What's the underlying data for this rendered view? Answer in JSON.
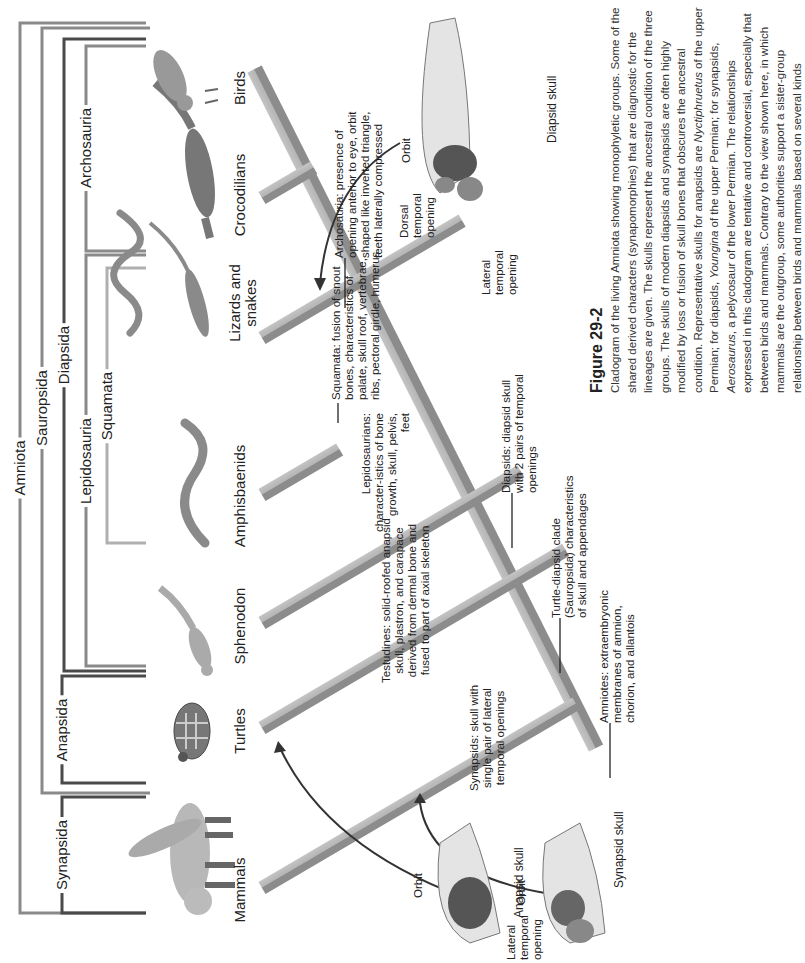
{
  "clades": {
    "amniota": "Amniota",
    "synapsida": "Synapsida",
    "sauropsida": "Sauropsida",
    "anapsida": "Anapsida",
    "diapsida": "Diapsida",
    "lepidosauria": "Lepidosauria",
    "archosauria": "Archosauria",
    "squamata": "Squamata"
  },
  "taxa": [
    {
      "label": "Mammals"
    },
    {
      "label": "Turtles"
    },
    {
      "label": "Sphenodon"
    },
    {
      "label": "Amphisbaenids"
    },
    {
      "label": "Lizards and snakes"
    },
    {
      "label": "Crocodilians"
    },
    {
      "label": "Birds"
    }
  ],
  "annotations": {
    "archosauria": "Archosauria: presence of opening anterior to eye, orbit shaped like inverted triangle, teeth laterally compressed",
    "squamata": "Squamata: fusion of snout bones, characteristics of palate, skull roof, vertebrae, ribs, pectoral girdle, humerus",
    "lepidosaurians": "Lepidosaurians: character-istics of bone growth, skull, pelvis, feet",
    "diapsids": "Diapsids: diapsid skull with 2 pairs of temporal openings",
    "testudines": "Testudines: solid-roofed anapsid skull, plastron, and carapace derived from dermal bone and fused to part of axial skeleton",
    "turtle_diapsid": "Turtle-diapsid clade (Sauropsida) characteristics of skull and appendages",
    "synapsids": "Synapsids: skull with single pair of lateral temporal openings",
    "amniotes": "Amniotes: extraembryonic membranes of amnion, chorion, and allantois"
  },
  "skulls": {
    "diapsid": {
      "caption": "Diapsid skull",
      "orbit": "Orbit",
      "dorsal": "Dorsal temporal opening",
      "lateral": "Lateral temporal opening"
    },
    "anapsid": {
      "caption": "Anapsid skull",
      "orbit": "Orbit"
    },
    "synapsid": {
      "caption": "Synapsid skull",
      "orbit": "Orbit",
      "lateral": "Lateral temporal opening"
    }
  },
  "figure": {
    "title": "Figure 29-2",
    "caption_parts": [
      "Cladogram of the living Amniota showing monophyletic groups. Some of the shared derived characters (synapomorphies) that are diagnostic for the lineages are given. The skulls represent the ancestral condition of the three groups. The skulls of modern diapsids and synapsids are often highly modified by loss or fusion of skull bones that obscures the ancestral condition. Representative skulls for anapsids are ",
      "Nyctiphruetus",
      " of the upper Permian; for diapsids, ",
      "Youngina",
      " of the upper Permian; for synapsids, ",
      "Aerosaurus",
      ", a pelycosaur of the lower Permian. The relationships expressed in this cladogram are tentative and controversial, especially that between birds and mammals. Contrary to the view shown here, in which mammals are the outgroup, some authorities support a sister-group relationship between birds and mammals based on several kinds"
    ]
  },
  "colors": {
    "bracket_dark": "#4a4a4a",
    "bracket_mid": "#8a8a8a",
    "bracket_light": "#b0b0b0",
    "beam": "#8f8f8f",
    "beam_light": "#b9b9b9"
  }
}
